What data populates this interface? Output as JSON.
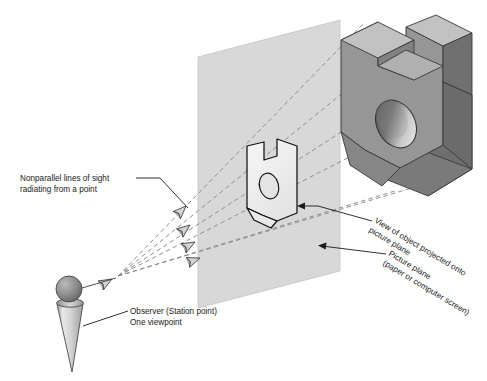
{
  "labels": {
    "sight_lines": {
      "line1": "Nonparallel lines of sight",
      "line2": "radiating from a point"
    },
    "observer": {
      "line1": "Observer (Station point)",
      "line2": "One viewpoint"
    },
    "projected_view": {
      "line1": "View of object projected onto",
      "line2": "picture plane"
    },
    "picture_plane": {
      "line1": "Picture plane",
      "line2": "(paper or computer screen)"
    }
  },
  "colors": {
    "background": "#ffffff",
    "picture_plane_fill": "#d8d8d8",
    "picture_plane_stroke": "#b8b8b8",
    "object_front_face": "#969696",
    "object_top_face": "#c2c2c2",
    "object_side_face": "#6e6e6e",
    "object_notch_face": "#7f7f7f",
    "object_outline": "#3a3a3a",
    "hole_gradient_dark": "#5e5e5e",
    "hole_gradient_light": "#e2e2e2",
    "projected_view_fill": "#efefef",
    "projected_view_stroke": "#111111",
    "sight_line_stroke": "#8c8c8c",
    "arrowhead_fill": "#d0d0d0",
    "arrowhead_stroke": "#444444",
    "observer_head_dark": "#6f6f6f",
    "observer_head_light": "#b9b9b9",
    "observer_body_light": "#eaeaea",
    "observer_body_mid": "#a8a8a8",
    "leader_stroke": "#1a1a1a",
    "text": "#1a1a1a"
  },
  "elements": {
    "object_name": "notched-block-with-through-hole",
    "picture_plane_shape": "parallelogram",
    "observer_shape": "cone-with-sphere-head",
    "sight_line_count": 4,
    "arrowhead_count": 5
  }
}
